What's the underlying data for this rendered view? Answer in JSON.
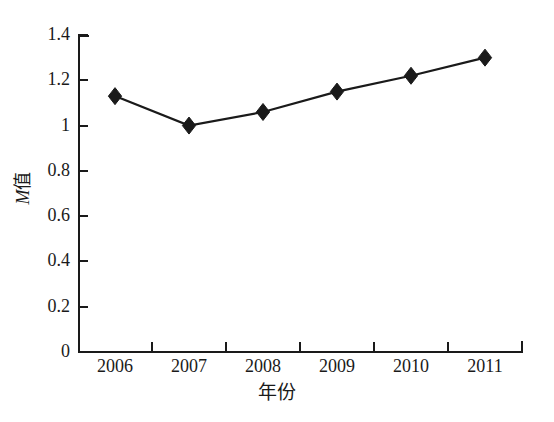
{
  "chart_data": {
    "type": "line",
    "title": "",
    "subtitle": "",
    "xlabel": "年份",
    "ylabel": "M值",
    "ylabel_italic_part": "M",
    "ylabel_plain_part": "值",
    "categories": [
      "2006",
      "2007",
      "2008",
      "2009",
      "2010",
      "2011"
    ],
    "values": [
      1.13,
      1.0,
      1.06,
      1.15,
      1.22,
      1.3
    ],
    "series": [
      {
        "name": "M值",
        "values": [
          1.13,
          1.0,
          1.06,
          1.15,
          1.22,
          1.3
        ],
        "marker": "diamond",
        "marker_color": "#1a1a1a",
        "line_color": "#1a1a1a"
      }
    ],
    "ylim": [
      0,
      1.4
    ],
    "yticks": [
      0,
      0.2,
      0.4,
      0.6,
      0.8,
      1,
      1.2,
      1.4
    ],
    "ytick_labels": [
      "0",
      "0.2",
      "0.4",
      "0.6",
      "0.8",
      "1",
      "1.2",
      "1.4"
    ],
    "xtick_labels": [
      "2006",
      "2007",
      "2008",
      "2009",
      "2010",
      "2011"
    ],
    "grid": false,
    "legend": false,
    "legend_position": "none",
    "annotations": []
  },
  "style": {
    "background": "#ffffff",
    "foreground": "#1a1a1a",
    "line_color": "#1a1a1a",
    "marker_color": "#1a1a1a"
  }
}
